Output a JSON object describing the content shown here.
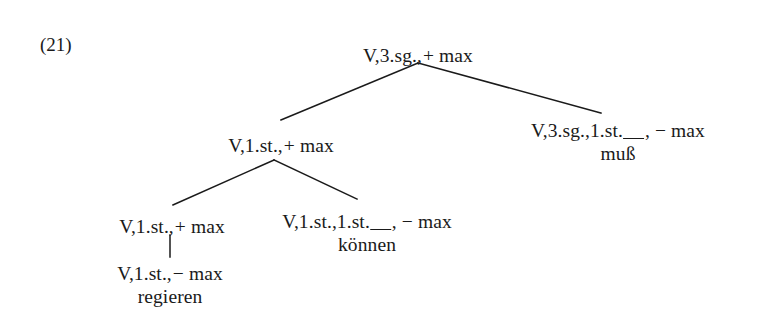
{
  "example": {
    "number": "(21)"
  },
  "diagram": {
    "type": "syntactic-tree",
    "language": "German",
    "line_color": "#1a1a1a",
    "background_color": "#ffffff",
    "nodes": [
      {
        "id": "root",
        "label": "V,3.sg., + max",
        "label_prefix": "V,3.sg.,",
        "sign": "+ max",
        "word": "",
        "x": 418,
        "y": 45,
        "has_gap": false
      },
      {
        "id": "n-left",
        "label": "V,1.st., + max",
        "label_prefix": "V,1.st.,",
        "sign": "+ max",
        "word": "",
        "x": 281,
        "y": 135,
        "has_gap": false
      },
      {
        "id": "n-muss",
        "label": "V,3.sg.,1.st.__, − max",
        "label_prefix": "V,3.sg.,1.st.",
        "sign": ", − max",
        "word": "muß",
        "x": 618,
        "y": 120,
        "has_gap": true
      },
      {
        "id": "n-left-left",
        "label": "V,1.st., + max",
        "label_prefix": "V,1.st.,",
        "sign": "+ max",
        "word": "",
        "x": 172,
        "y": 216,
        "has_gap": false
      },
      {
        "id": "n-koennen",
        "label": "V,1.st.,1.st.__, − max",
        "label_prefix": "V,1.st.,1.st.",
        "sign": ", − max",
        "word": "können",
        "x": 367,
        "y": 211,
        "has_gap": true
      },
      {
        "id": "n-regieren",
        "label": "V,1.st., − max",
        "label_prefix": "V,1.st.,",
        "sign": "− max",
        "word": "regieren",
        "x": 170,
        "y": 263,
        "has_gap": false
      }
    ],
    "edges": [
      {
        "from": "root",
        "to": "n-left",
        "x1": 418,
        "y1": 63,
        "x2": 281,
        "y2": 120
      },
      {
        "from": "root",
        "to": "n-muss",
        "x1": 418,
        "y1": 63,
        "x2": 601,
        "y2": 113
      },
      {
        "from": "n-left",
        "to": "n-left-left",
        "x1": 274,
        "y1": 160,
        "x2": 173,
        "y2": 205
      },
      {
        "from": "n-left",
        "to": "n-koennen",
        "x1": 274,
        "y1": 160,
        "x2": 357,
        "y2": 199
      },
      {
        "from": "n-left-left",
        "to": "n-regieren",
        "x1": 170,
        "y1": 235,
        "x2": 170,
        "y2": 257
      }
    ]
  }
}
